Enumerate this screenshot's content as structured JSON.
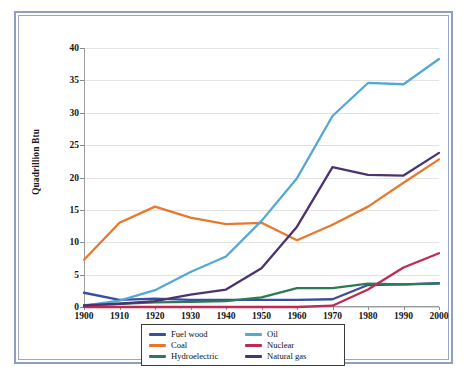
{
  "chart_data": {
    "type": "line",
    "title": "",
    "xlabel": "",
    "ylabel": "Quadrillion Btu",
    "x": [
      1900,
      1910,
      1920,
      1930,
      1940,
      1950,
      1960,
      1970,
      1980,
      1990,
      2000
    ],
    "xtick_labels": [
      "1900",
      "1910",
      "1920",
      "1930",
      "1940",
      "1950",
      "1960",
      "1970",
      "1980",
      "1990",
      "2000"
    ],
    "ytick_labels": [
      "0",
      "5",
      "10",
      "15",
      "20",
      "25",
      "30",
      "35",
      "40"
    ],
    "yticks": [
      0,
      5,
      10,
      15,
      20,
      25,
      30,
      35,
      40
    ],
    "xlim": [
      1900,
      2000
    ],
    "ylim": [
      0,
      40
    ],
    "grid": "horizontal",
    "legend_position": "below-center",
    "series": [
      {
        "name": "Fuel wood",
        "color": "#3a4ea0",
        "values": [
          2.2,
          1.1,
          1.3,
          1.1,
          1.1,
          1.1,
          1.1,
          1.2,
          3.4,
          3.5,
          3.7
        ]
      },
      {
        "name": "Coal",
        "color": "#e8782c",
        "values": [
          7.3,
          13.0,
          15.5,
          13.8,
          12.8,
          13.0,
          10.3,
          12.7,
          15.5,
          19.2,
          22.8
        ]
      },
      {
        "name": "Hydroelectric",
        "color": "#2e7a54",
        "values": [
          0.3,
          0.5,
          0.7,
          0.8,
          0.9,
          1.5,
          2.9,
          2.9,
          3.6,
          3.5,
          3.6
        ]
      },
      {
        "name": "Oil",
        "color": "#53a8d4",
        "values": [
          0.2,
          1.0,
          2.6,
          5.4,
          7.8,
          13.3,
          19.9,
          29.5,
          34.6,
          34.4,
          38.3
        ]
      },
      {
        "name": "Nuclear",
        "color": "#bf2a55",
        "values": [
          0.0,
          0.0,
          0.0,
          0.0,
          0.0,
          0.0,
          0.0,
          0.2,
          2.7,
          6.1,
          8.3
        ]
      },
      {
        "name": "Natural gas",
        "color": "#4a3370",
        "values": [
          0.25,
          0.5,
          0.9,
          1.9,
          2.7,
          6.0,
          12.4,
          21.6,
          20.4,
          20.3,
          23.8
        ]
      }
    ]
  },
  "legend": {
    "items": [
      {
        "label": "Fuel wood",
        "color": "#3a4ea0"
      },
      {
        "label": "Coal",
        "color": "#e8782c"
      },
      {
        "label": "Hydroelectric",
        "color": "#2e7a54"
      },
      {
        "label": "Oil",
        "color": "#53a8d4"
      },
      {
        "label": "Nuclear",
        "color": "#bf2a55"
      },
      {
        "label": "Natural gas",
        "color": "#4a3370"
      }
    ]
  },
  "frame": {
    "border_color": "#8f9fc0",
    "background": "#ffffff"
  }
}
